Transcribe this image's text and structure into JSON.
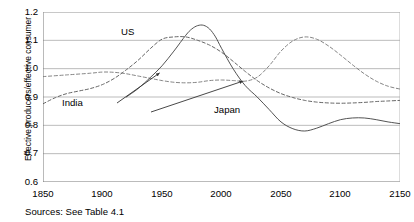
{
  "chart_data": {
    "type": "line",
    "title": "",
    "xlabel": "",
    "ylabel": "Effective producers/effective consumer",
    "xlim": [
      1850,
      2150
    ],
    "ylim": [
      0.6,
      1.2
    ],
    "xticks": [
      1850,
      1900,
      1950,
      2000,
      2050,
      2100,
      2150
    ],
    "yticks": [
      0.6,
      0.7,
      0.8,
      0.9,
      1.0,
      1.1,
      1.2
    ],
    "grid": true,
    "legend_position": "inline-annotations",
    "annotations": [
      {
        "text": "US",
        "x": 1955,
        "y": 1.135
      },
      {
        "text": "India",
        "x": 1905,
        "y": 0.905
      },
      {
        "text": "Japan",
        "x": 2000,
        "y": 0.875
      }
    ],
    "series": [
      {
        "name": "US",
        "style": "dashed",
        "color": "#555555",
        "x": [
          1850,
          1860,
          1870,
          1880,
          1890,
          1900,
          1910,
          1920,
          1930,
          1940,
          1950,
          1960,
          1970,
          1980,
          1990,
          2000,
          2010,
          2020,
          2030,
          2040,
          2050,
          2060,
          2070,
          2080,
          2090,
          2100,
          2110,
          2120,
          2130,
          2140,
          2150
        ],
        "values": [
          0.876,
          0.897,
          0.912,
          0.921,
          0.93,
          0.944,
          0.966,
          0.996,
          1.03,
          1.07,
          1.104,
          1.112,
          1.112,
          1.1,
          1.083,
          1.058,
          1.025,
          0.99,
          0.958,
          0.932,
          0.912,
          0.898,
          0.888,
          0.882,
          0.879,
          0.878,
          0.879,
          0.881,
          0.884,
          0.886,
          0.888
        ]
      },
      {
        "name": "India",
        "style": "dashed",
        "color": "#777777",
        "x": [
          1850,
          1870,
          1890,
          1900,
          1910,
          1920,
          1930,
          1940,
          1950,
          1960,
          1970,
          1980,
          1990,
          2000,
          2010,
          2020,
          2030,
          2040,
          2050,
          2060,
          2070,
          2080,
          2090,
          2100,
          2110,
          2120,
          2130,
          2140,
          2150
        ],
        "values": [
          0.972,
          0.978,
          0.984,
          0.988,
          0.987,
          0.982,
          0.974,
          0.966,
          0.958,
          0.952,
          0.95,
          0.952,
          0.958,
          0.96,
          0.958,
          0.956,
          0.97,
          1.01,
          1.062,
          1.098,
          1.112,
          1.104,
          1.08,
          1.048,
          1.014,
          0.982,
          0.956,
          0.938,
          0.928
        ]
      },
      {
        "name": "Japan",
        "style": "solid",
        "color": "#4a4a4a",
        "x": [
          1920,
          1930,
          1940,
          1950,
          1960,
          1970,
          1975,
          1980,
          1985,
          1990,
          1995,
          2000,
          2010,
          2020,
          2030,
          2040,
          2050,
          2060,
          2070,
          2080,
          2090,
          2100,
          2110,
          2120,
          2130,
          2140,
          2150
        ],
        "values": [
          0.9,
          0.93,
          0.968,
          1.01,
          1.062,
          1.118,
          1.14,
          1.152,
          1.153,
          1.14,
          1.112,
          1.072,
          0.998,
          0.94,
          0.9,
          0.856,
          0.812,
          0.788,
          0.78,
          0.79,
          0.806,
          0.82,
          0.826,
          0.826,
          0.82,
          0.812,
          0.806
        ]
      }
    ]
  },
  "axis": {
    "y_title": "Effective producers/effective consumer",
    "y_tick_labels": [
      "1.2",
      "1.1",
      "1.0",
      "0.9",
      "0.8",
      "0.7",
      "0.6"
    ],
    "x_tick_labels": [
      "1850",
      "1900",
      "1950",
      "2000",
      "2050",
      "2100",
      "2150"
    ]
  },
  "labels": {
    "us": "US",
    "india": "India",
    "japan": "Japan"
  },
  "footer": {
    "source": "Sources:  See Table 4.1"
  },
  "colors": {
    "grid": "#aaaaaa",
    "axis": "#777777",
    "us": "#555555",
    "india": "#8a8a8a",
    "japan": "#4a4a4a",
    "text": "#000000"
  }
}
